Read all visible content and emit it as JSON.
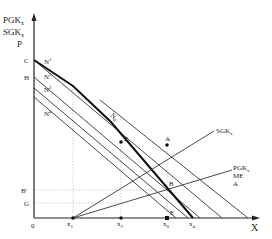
{
  "axes": {
    "y_label_lines": [
      "PGK",
      "SGK",
      "P"
    ],
    "y_label_subscripts": [
      "x",
      "x",
      ""
    ],
    "x_label": "X",
    "origin": "0"
  },
  "y_ticks": {
    "C": "C",
    "H": "H",
    "B_prime": "B'",
    "G": "G"
  },
  "x_ticks": {
    "x1": "x",
    "x1_sub": "1",
    "x2": "x",
    "x2_sub": "2",
    "x0": "x",
    "x0_sub": "0",
    "x4": "x",
    "x4_sub": "4"
  },
  "curves": {
    "N1": "N",
    "N1_sup": "1",
    "N2": "N",
    "N2_sup": "2",
    "N3": "N",
    "N3_sup": "3",
    "N4": "N",
    "N4_sup": "4",
    "N0": "N",
    "N0_sub": "0",
    "SGK": "SGK",
    "SGK_sub": "x",
    "PGK": "PGK",
    "PGK_sub": "x",
    "ME": "ME",
    "A_line": "A"
  },
  "points": {
    "Z": "Z",
    "A": "A",
    "B": "B",
    "E": "E"
  },
  "colors": {
    "ink": "#222222",
    "guide": "#bbbbbb"
  }
}
